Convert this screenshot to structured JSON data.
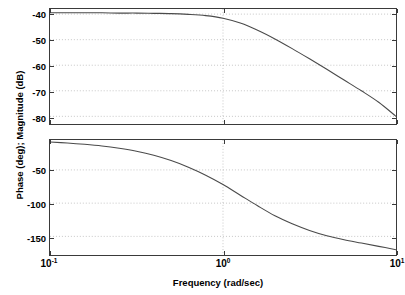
{
  "figure": {
    "ylabel": "Phase (deg); Magnitude (dB)",
    "xlabel": "Frequency (rad/sec)",
    "axis_color": "#3a3a3a",
    "curve_color": "#4a4a4a",
    "grid_color": "#b8b8b8",
    "background": "#ffffff"
  },
  "xaxis": {
    "ticks": [
      {
        "mantissa": "10",
        "exponent": "-1",
        "value": -1
      },
      {
        "mantissa": "10",
        "exponent": "0",
        "value": 0
      },
      {
        "mantissa": "10",
        "exponent": "1",
        "value": 1
      }
    ]
  },
  "magnitude_panel": {
    "yticks": [
      "-40",
      "-50",
      "-60",
      "-70",
      "-80"
    ]
  },
  "phase_panel": {
    "yticks": [
      "-50",
      "-100",
      "-150"
    ]
  },
  "chart_data": [
    {
      "type": "line",
      "title": "",
      "subtitle": "",
      "xlabel": "Frequency (rad/sec)",
      "ylabel": "Magnitude (dB)",
      "xscale": "log",
      "xlim": [
        -1,
        1
      ],
      "ylim": [
        -83,
        -38
      ],
      "xtick_labels": [
        "10^-1",
        "10^0",
        "10^1"
      ],
      "ytick_values": [
        -40,
        -50,
        -60,
        -70,
        -80
      ],
      "grid": true,
      "legend": null,
      "series": [
        {
          "name": "Magnitude",
          "x_log10": [
            -1.0,
            -0.9,
            -0.8,
            -0.7,
            -0.6,
            -0.5,
            -0.4,
            -0.3,
            -0.2,
            -0.1,
            0.0,
            0.1,
            0.2,
            0.3,
            0.4,
            0.5,
            0.6,
            0.7,
            0.8,
            0.9,
            1.0
          ],
          "values": [
            -39.5,
            -39.5,
            -39.5,
            -39.5,
            -39.6,
            -39.6,
            -39.7,
            -39.8,
            -40.1,
            -40.6,
            -41.6,
            -43.5,
            -46.3,
            -49.7,
            -53.5,
            -57.5,
            -61.6,
            -65.8,
            -70.0,
            -74.5,
            -80.0
          ]
        }
      ]
    },
    {
      "type": "line",
      "title": "",
      "subtitle": "",
      "xlabel": "Frequency (rad/sec)",
      "ylabel": "Phase (deg)",
      "xscale": "log",
      "xlim": [
        -1,
        1
      ],
      "ylim": [
        -178,
        -5
      ],
      "xtick_labels": [
        "10^-1",
        "10^0",
        "10^1"
      ],
      "ytick_values": [
        -50,
        -100,
        -150
      ],
      "grid": true,
      "legend": null,
      "series": [
        {
          "name": "Phase",
          "x_log10": [
            -1.0,
            -0.9,
            -0.8,
            -0.7,
            -0.6,
            -0.5,
            -0.4,
            -0.3,
            -0.2,
            -0.1,
            0.0,
            0.1,
            0.2,
            0.3,
            0.4,
            0.5,
            0.6,
            0.7,
            0.8,
            0.9,
            1.0
          ],
          "values": [
            -8.0,
            -9.5,
            -11.5,
            -14.0,
            -17.5,
            -22.0,
            -28.0,
            -36.0,
            -46.0,
            -58.0,
            -72.0,
            -88.0,
            -104.0,
            -119.0,
            -131.0,
            -141.0,
            -149.0,
            -155.0,
            -160.0,
            -165.0,
            -170.0
          ]
        }
      ]
    }
  ]
}
